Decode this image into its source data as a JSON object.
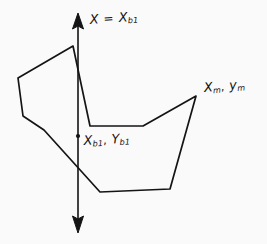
{
  "figure": {
    "background_color": "#fbfafa",
    "ink_color": "#141414"
  },
  "axis": {
    "name": "vertical-axis",
    "orientation": "vertical",
    "x_position": 78,
    "top_y": 14,
    "bottom_y": 231,
    "arrowhead_top": true,
    "arrowhead_bottom": true,
    "label": {
      "variable": "X",
      "operator": "=",
      "equals_variable": "X",
      "equals_subscript": "b1",
      "text": "X = Xb1"
    }
  },
  "base_point": {
    "name": "base-point-marker",
    "x": 78,
    "y": 136,
    "label": {
      "x_variable": "X",
      "x_subscript": "b1",
      "separator": ",",
      "y_variable": "Y",
      "y_subscript": "b1",
      "text": "Xb1, Yb1"
    }
  },
  "m_point": {
    "name": "m-point-vertex",
    "x": 196,
    "y": 96,
    "label": {
      "x_variable": "X",
      "x_subscript": "m",
      "separator": ",",
      "y_variable": "y",
      "y_subscript": "m",
      "text": "Xm, ym"
    }
  },
  "polygon": {
    "name": "hand-drawn-polygon",
    "closed": true,
    "fill": "none",
    "stroke_width": 1.7,
    "vertices": [
      [
        73,
        46
      ],
      [
        18,
        78
      ],
      [
        23,
        116
      ],
      [
        44,
        130
      ],
      [
        100,
        192
      ],
      [
        170,
        189
      ],
      [
        196,
        96
      ],
      [
        143,
        126
      ],
      [
        90,
        126
      ]
    ]
  }
}
